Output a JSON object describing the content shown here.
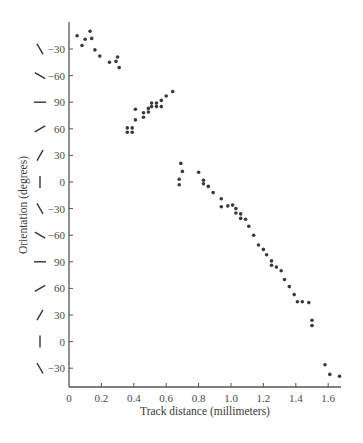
{
  "chart_data": {
    "type": "scatter",
    "title": "",
    "xlabel": "Track distance (millimeters)",
    "ylabel": "Orientation (degrees)",
    "xlim": [
      0,
      1.68
    ],
    "x_ticks": [
      0,
      0.2,
      0.4,
      0.6,
      0.8,
      1.0,
      1.2,
      1.4,
      1.6
    ],
    "x_tick_labels": [
      "0",
      "0.2",
      "0.4",
      "0.6",
      "0.8",
      "1.0",
      "1.2",
      "1.4",
      "1.6"
    ],
    "y_tick_labels": [
      "−30",
      "−60",
      "90",
      "60",
      "30",
      "0",
      "−30",
      "−60",
      "90",
      "60",
      "30",
      "0",
      "−30"
    ],
    "y_tick_orientation_glyphs_deg": [
      -30,
      -60,
      90,
      60,
      30,
      0,
      -30,
      -60,
      90,
      60,
      30,
      0,
      -30
    ],
    "y_axis_note": "Orientation wraps modulo 180; values below are unwrapped (continuous) degrees, each tick step = -30",
    "grid": false,
    "legend": null,
    "series": [
      {
        "name": "orientation",
        "points": [
          [
            0.05,
            -15
          ],
          [
            0.08,
            -26
          ],
          [
            0.1,
            -19
          ],
          [
            0.13,
            -10
          ],
          [
            0.14,
            -18
          ],
          [
            0.16,
            -31
          ],
          [
            0.19,
            -38
          ],
          [
            0.25,
            -45
          ],
          [
            0.29,
            -44
          ],
          [
            0.3,
            -39
          ],
          [
            0.31,
            -51
          ],
          [
            0.36,
            -119
          ],
          [
            0.36,
            -124
          ],
          [
            0.39,
            -119
          ],
          [
            0.39,
            -124
          ],
          [
            0.41,
            -110
          ],
          [
            0.41,
            -98
          ],
          [
            0.46,
            -102
          ],
          [
            0.46,
            -107
          ],
          [
            0.49,
            -101
          ],
          [
            0.49,
            -97
          ],
          [
            0.51,
            -95
          ],
          [
            0.51,
            -91
          ],
          [
            0.54,
            -95
          ],
          [
            0.54,
            -91
          ],
          [
            0.57,
            -95
          ],
          [
            0.57,
            -88
          ],
          [
            0.6,
            -83
          ],
          [
            0.64,
            -78
          ],
          [
            0.69,
            -159
          ],
          [
            0.7,
            -168
          ],
          [
            0.68,
            -177
          ],
          [
            0.68,
            -183
          ],
          [
            0.8,
            -169
          ],
          [
            0.83,
            -178
          ],
          [
            0.83,
            -182
          ],
          [
            0.86,
            -185
          ],
          [
            0.89,
            -192
          ],
          [
            0.94,
            -199
          ],
          [
            0.94,
            -208
          ],
          [
            0.98,
            -207
          ],
          [
            1.01,
            -206
          ],
          [
            1.03,
            -210
          ],
          [
            1.03,
            -215
          ],
          [
            1.06,
            -216
          ],
          [
            1.06,
            -221
          ],
          [
            1.09,
            -222
          ],
          [
            1.11,
            -230
          ],
          [
            1.14,
            -240
          ],
          [
            1.17,
            -251
          ],
          [
            1.2,
            -256
          ],
          [
            1.22,
            -262
          ],
          [
            1.25,
            -269
          ],
          [
            1.25,
            -274
          ],
          [
            1.28,
            -276
          ],
          [
            1.31,
            -280
          ],
          [
            1.33,
            -290
          ],
          [
            1.36,
            -298
          ],
          [
            1.39,
            -307
          ],
          [
            1.41,
            -315
          ],
          [
            1.44,
            -315
          ],
          [
            1.48,
            -316
          ],
          [
            1.5,
            -336
          ],
          [
            1.5,
            -342
          ],
          [
            1.58,
            -386
          ],
          [
            1.61,
            -397
          ],
          [
            1.67,
            -399
          ]
        ]
      }
    ]
  },
  "colors": {
    "axis": "#555555",
    "point": "#3a3a3a",
    "text": "#4a4a4a",
    "background": "#ffffff"
  }
}
